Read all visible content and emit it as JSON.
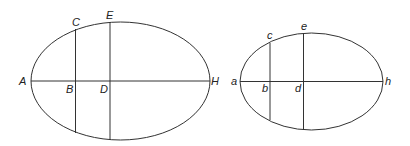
{
  "diagram": {
    "large_ellipse": {
      "labels": {
        "A": "A",
        "B": "B",
        "C": "C",
        "D": "D",
        "E": "E",
        "H": "H"
      }
    },
    "small_ellipse": {
      "labels": {
        "a": "a",
        "b": "b",
        "c": "c",
        "d": "d",
        "e": "e",
        "h": "h"
      }
    },
    "stroke_color": "#333333"
  }
}
